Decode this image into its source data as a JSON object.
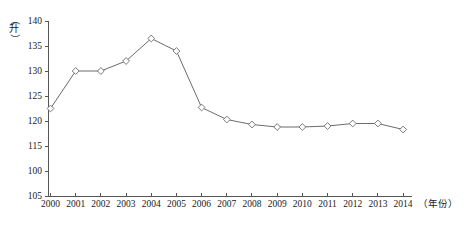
{
  "chart_data": {
    "type": "line",
    "title": "",
    "xlabel": "（年份）",
    "ylabel": "（升）",
    "categories": [
      "2000",
      "2001",
      "2002",
      "2003",
      "2004",
      "2005",
      "2006",
      "2007",
      "2008",
      "2009",
      "2010",
      "2011",
      "2012",
      "2013",
      "2014"
    ],
    "values": [
      122.5,
      130.0,
      130.0,
      132.0,
      136.5,
      134.0,
      122.7,
      120.3,
      119.3,
      118.8,
      118.8,
      119.0,
      119.5,
      119.5,
      118.3
    ],
    "series": [
      {
        "name": "升",
        "values": [
          122.5,
          130.0,
          130.0,
          132.0,
          136.5,
          134.0,
          122.7,
          120.3,
          119.3,
          118.8,
          118.8,
          119.0,
          119.5,
          119.5,
          118.3
        ]
      }
    ],
    "y_tick_labels": [
      "140",
      "135",
      "130",
      "125",
      "120",
      "115",
      "100",
      "105"
    ],
    "y_tick_values": [
      140,
      135,
      130,
      125,
      120,
      115,
      110,
      105
    ],
    "ylim": [
      105,
      140
    ],
    "xlim": [
      "2000",
      "2014"
    ],
    "grid": false,
    "legend": "none",
    "marker": "open-diamond",
    "line_color": "#6b6b6b",
    "marker_fill": "#ffffff",
    "axis_color": "#555555"
  }
}
